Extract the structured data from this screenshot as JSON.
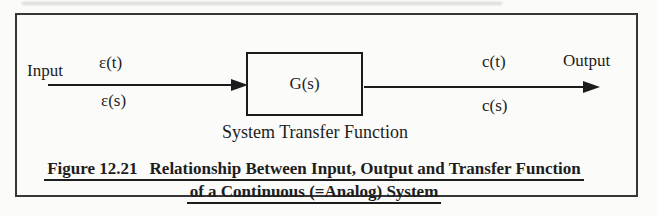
{
  "figure": {
    "input_label": "Input",
    "output_label": "Output",
    "input_signal_time": "ε(t)",
    "input_signal_laplace": "ε(s)",
    "output_signal_time": "c(t)",
    "output_signal_laplace": "c(s)",
    "block_label": "G(s)",
    "block_caption": "System Transfer Function"
  },
  "caption": {
    "figure_number": "Figure 12.21",
    "title_line1": "Relationship Between Input, Output and Transfer Function",
    "title_line2": "of a Continuous (=Analog) System"
  },
  "colors": {
    "ink": "#1c1c1c",
    "frame_border": "#373737",
    "background": "#fbfbf9"
  }
}
